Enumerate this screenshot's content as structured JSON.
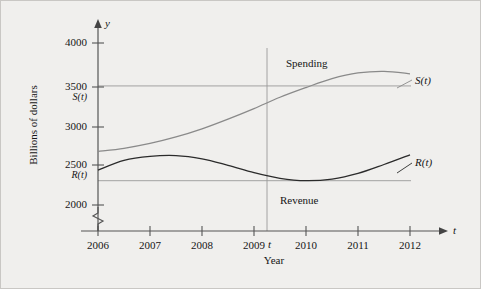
{
  "figure": {
    "background_color": "#f0efed",
    "border_color": "#c9c7c4",
    "axis_color": "#555555",
    "spending_curve_color": "#8a8a8a",
    "revenue_curve_color": "#2b2b2b",
    "reference_line_color": "#9a9a9a"
  },
  "axes": {
    "y_axis_name": "y",
    "x_axis_name": "t",
    "y_axis_title": "Billions of dollars",
    "x_axis_title": "Year",
    "y_ticks": [
      "2000",
      "2500",
      "3000",
      "3500",
      "4000"
    ],
    "x_ticks": [
      "2006",
      "2007",
      "2008",
      "2009",
      "2010",
      "2011",
      "2012"
    ],
    "break_symbol": "axis-break-zigzag"
  },
  "annotations": {
    "spending_label": "Spending",
    "revenue_label": "Revenue",
    "spending_function_label": "S(t)",
    "revenue_function_label": "R(t)",
    "spending_level_label": "S(t)",
    "revenue_level_label": "R(t)",
    "t_marker_label": "t"
  },
  "chart_data": {
    "type": "line",
    "title": "",
    "xlabel": "Year",
    "ylabel": "Billions of dollars",
    "xlim": [
      2006,
      2012
    ],
    "ylim": [
      1950,
      4100
    ],
    "y_ticks": [
      2000,
      2500,
      3000,
      3500,
      4000
    ],
    "x_ticks": [
      2006,
      2007,
      2008,
      2009,
      2010,
      2011,
      2012
    ],
    "grid": false,
    "legend": "inline-curve-labels",
    "series": [
      {
        "name": "Spending",
        "label": "S(t)",
        "color": "#8a8a8a",
        "x": [
          2006,
          2006.5,
          2007,
          2007.5,
          2008,
          2008.5,
          2009,
          2009.5,
          2010,
          2010.5,
          2011,
          2011.5,
          2012
        ],
        "values": [
          2660,
          2700,
          2760,
          2840,
          2940,
          3060,
          3190,
          3330,
          3450,
          3560,
          3630,
          3650,
          3620
        ]
      },
      {
        "name": "Revenue",
        "label": "R(t)",
        "color": "#2b2b2b",
        "x": [
          2006,
          2006.5,
          2007,
          2007.5,
          2008,
          2008.5,
          2009,
          2009.5,
          2010,
          2010.5,
          2011,
          2011.5,
          2012
        ],
        "values": [
          2430,
          2550,
          2600,
          2610,
          2570,
          2490,
          2400,
          2330,
          2300,
          2320,
          2390,
          2500,
          2620
        ]
      }
    ],
    "reference_lines": [
      {
        "name": "S(t)",
        "type": "horizontal",
        "value": 3470
      },
      {
        "name": "R(t)",
        "type": "horizontal",
        "value": 2300
      },
      {
        "name": "t",
        "type": "vertical",
        "value": 2009.25
      }
    ],
    "annotations": [
      {
        "text": "Spending",
        "x": 2010.05,
        "y": 3820
      },
      {
        "text": "Revenue",
        "x": 2009.8,
        "y": 2120
      },
      {
        "text": "S(t)",
        "x": 2012.3,
        "y": 3560
      },
      {
        "text": "R(t)",
        "x": 2012.3,
        "y": 2660
      },
      {
        "text": "t",
        "x": 2009.35,
        "y": 1960
      }
    ]
  }
}
